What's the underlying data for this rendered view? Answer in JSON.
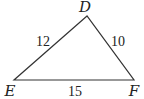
{
  "diagram": {
    "type": "triangle",
    "vertices": [
      {
        "name": "D",
        "x": 87,
        "y": 16,
        "label_x": 85,
        "label_y": 12
      },
      {
        "name": "E",
        "x": 14,
        "y": 80,
        "label_x": 10,
        "label_y": 96
      },
      {
        "name": "F",
        "x": 134,
        "y": 80,
        "label_x": 134,
        "label_y": 96
      }
    ],
    "sides": [
      {
        "from": "E",
        "to": "D",
        "length": "12",
        "label_x": 43,
        "label_y": 46
      },
      {
        "from": "D",
        "to": "F",
        "length": "10",
        "label_x": 118,
        "label_y": 46
      },
      {
        "from": "E",
        "to": "F",
        "length": "15",
        "label_x": 75,
        "label_y": 96
      }
    ],
    "stroke_color": "#333333"
  }
}
